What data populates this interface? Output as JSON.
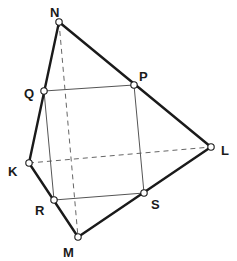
{
  "diagram": {
    "type": "geometry",
    "colors": {
      "stroke": "#1a1a1a",
      "thin": "#555555",
      "dashed": "#666666",
      "vertex_fill": "#ffffff"
    },
    "points": {
      "N": {
        "label": "N",
        "x": 59,
        "y": 22,
        "lx": 50,
        "ly": 17
      },
      "P": {
        "label": "P",
        "x": 134,
        "y": 85,
        "lx": 139,
        "ly": 81
      },
      "Q": {
        "label": "Q",
        "x": 44,
        "y": 91,
        "lx": 24,
        "ly": 98
      },
      "L": {
        "label": "L",
        "x": 211,
        "y": 147,
        "lx": 221,
        "ly": 155
      },
      "K": {
        "label": "K",
        "x": 29,
        "y": 163,
        "lx": 8,
        "ly": 176
      },
      "R": {
        "label": "R",
        "x": 54,
        "y": 200,
        "lx": 35,
        "ly": 215
      },
      "S": {
        "label": "S",
        "x": 144,
        "y": 193,
        "lx": 151,
        "ly": 209
      },
      "M": {
        "label": "M",
        "x": 78,
        "y": 237,
        "lx": 63,
        "ly": 257
      }
    },
    "edges_thick": [
      [
        "N",
        "L"
      ],
      [
        "L",
        "M"
      ],
      [
        "M",
        "K"
      ],
      [
        "K",
        "N"
      ]
    ],
    "edges_thin": [
      [
        "Q",
        "P"
      ],
      [
        "P",
        "S"
      ],
      [
        "S",
        "R"
      ],
      [
        "R",
        "Q"
      ]
    ],
    "edges_dashed": [
      [
        "N",
        "M"
      ],
      [
        "K",
        "L"
      ]
    ]
  }
}
